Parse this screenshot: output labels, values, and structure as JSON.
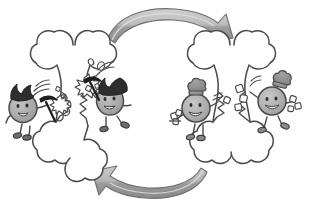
{
  "illustration": {
    "title": "Bone Remodeling Cycle",
    "subject": "bone-remodeling",
    "background_color": "#ffffff",
    "width": 317,
    "height": 219,
    "style": "hand-drawn cartoon line art, grayscale"
  },
  "palette": {
    "outline": "#3a3a3a",
    "bone_fill": "#ffffff",
    "cell_body_fill": "#a8a8a8",
    "cell_body_fill_light": "#bdbdbd",
    "cell_outline": "#4a4a4a",
    "osteoclast_hair": "#2e2e2e",
    "osteoblast_hat": "#8f8f8f",
    "arrow_fill": "#a6a6a6",
    "arrow_fill_light": "#d0d0d0",
    "arrow_outline": "#6b6b6b",
    "block_fill": "#ffffff",
    "tool_fill": "#1f1f1f"
  },
  "stages": [
    {
      "id": "resorption",
      "name": "bone-resorption",
      "label": "Bone resorption",
      "side": "left",
      "bone_state": "broken",
      "cell_type": "osteoclast",
      "cell_count": 2,
      "tool": "pickaxe",
      "hat": "spiky-hair"
    },
    {
      "id": "formation",
      "name": "bone-formation",
      "label": "Bone formation",
      "side": "right",
      "bone_state": "rebuilding",
      "cell_type": "osteoblast",
      "cell_count": 2,
      "tool": "bone-blocks",
      "hat": "chef-toque"
    }
  ],
  "bones": [
    {
      "id": "bone-left",
      "label": "Broken bone being resorbed",
      "state": "broken",
      "crack": true
    },
    {
      "id": "bone-right",
      "label": "Bone being rebuilt",
      "state": "rebuilding",
      "crack": true
    }
  ],
  "characters": [
    {
      "id": "osteoclast-1",
      "name": "osteoclast-left-outer",
      "type": "osteoclast",
      "label": "Osteoclast with pickaxe",
      "expression": "smiling",
      "accessory": "pickaxe",
      "hair": "spiky-dark",
      "position": "left-outer"
    },
    {
      "id": "osteoclast-2",
      "name": "osteoclast-left-inner",
      "type": "osteoclast",
      "label": "Osteoclast swinging pickaxe at bone",
      "expression": "smiling",
      "accessory": "pickaxe",
      "hair": "spiky-dark",
      "position": "left-inner"
    },
    {
      "id": "osteoblast-1",
      "name": "osteoblast-right-inner",
      "type": "osteoblast",
      "label": "Osteoblast carrying bone material",
      "expression": "smiling",
      "accessory": "bone-blocks",
      "hair": "chef-toque",
      "position": "right-inner"
    },
    {
      "id": "osteoblast-2",
      "name": "osteoblast-right-outer",
      "type": "osteoblast",
      "label": "Osteoblast placing bone material",
      "expression": "smiling",
      "accessory": "bone-blocks",
      "hair": "chef-toque",
      "position": "right-outer"
    }
  ],
  "arrows": [
    {
      "id": "arrow-top",
      "name": "arrow-resorption-to-formation",
      "direction": "left-to-right",
      "label": "Resorption leads to formation",
      "points_to": "right"
    },
    {
      "id": "arrow-bottom",
      "name": "arrow-formation-to-resorption",
      "direction": "right-to-left",
      "label": "Formation cycles back to resorption",
      "points_to": "left"
    }
  ],
  "effects": [
    {
      "id": "impact-left",
      "name": "impact-burst-left",
      "label": "Chipping impact burst"
    },
    {
      "id": "impact-mid",
      "name": "impact-burst-middle",
      "label": "Chipping impact burst"
    },
    {
      "id": "debris",
      "name": "bone-debris-particles",
      "label": "Bone fragments flying off"
    },
    {
      "id": "motion-left",
      "name": "motion-lines-left",
      "label": "Swing motion lines"
    },
    {
      "id": "motion-right",
      "name": "motion-lines-right",
      "label": "Swing motion lines"
    }
  ]
}
